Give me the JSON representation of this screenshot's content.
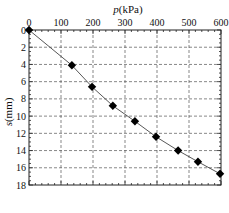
{
  "chart_data": {
    "type": "line",
    "title": "",
    "xlabel": "p(kPa)",
    "ylabel": "s(mm)",
    "x_axis_position": "top",
    "y_axis_inverted": true,
    "xlim": [
      0,
      600
    ],
    "ylim": [
      0,
      18
    ],
    "xticks": [
      0,
      100,
      200,
      300,
      400,
      500,
      600
    ],
    "yticks": [
      0,
      2,
      4,
      6,
      8,
      10,
      12,
      14,
      16,
      18
    ],
    "grid": true,
    "grid_style": "dashed",
    "marker": "diamond",
    "series": [
      {
        "name": "p-s curve",
        "x": [
          0,
          134,
          197,
          262,
          331,
          397,
          466,
          528,
          597
        ],
        "y": [
          0,
          4.1,
          6.6,
          8.8,
          10.6,
          12.4,
          14.0,
          15.3,
          16.7
        ]
      }
    ]
  },
  "labels": {
    "x_title_italic": "p",
    "x_title_unit": "(kPa)",
    "y_title_italic": "s",
    "y_title_unit": "(mm)"
  }
}
